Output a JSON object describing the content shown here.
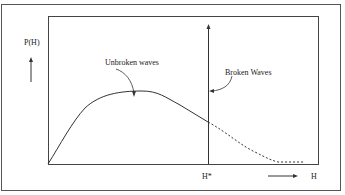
{
  "diagram": {
    "y_axis_label": "P(H)",
    "x_axis_label": "H",
    "threshold_label": "H*",
    "annotations": {
      "unbroken": "Unbroken waves",
      "broken": "Broken Waves"
    },
    "colors": {
      "line": "#333333",
      "frame": "#555555"
    }
  }
}
